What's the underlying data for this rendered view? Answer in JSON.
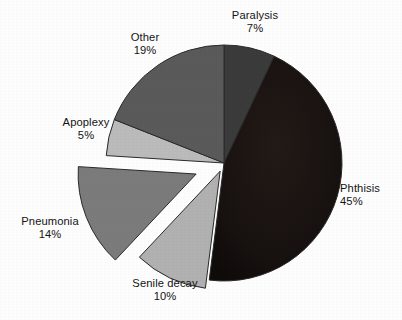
{
  "chart_data": {
    "type": "pie",
    "title": "",
    "subtitle": "",
    "xlabel": "",
    "ylabel": "",
    "legend_position": "none",
    "grid": false,
    "value_unit": "percent",
    "start_angle_deg": 0,
    "direction": "clockwise",
    "center": {
      "x": 224,
      "y": 163
    },
    "radius": 118,
    "categories": [
      "Paralysis",
      "Phthisis",
      "Senile decay",
      "Pneumonia",
      "Apoplexy",
      "Other"
    ],
    "values": [
      7,
      45,
      10,
      14,
      5,
      19
    ],
    "slices": [
      {
        "label": "Paralysis",
        "value": 7,
        "value_text": "7%",
        "color": "#3b3b3b",
        "exploded": false,
        "explode_offset": 0,
        "start_deg": 0,
        "end_deg": 25.2
      },
      {
        "label": "Phthisis",
        "value": 45,
        "value_text": "45%",
        "color": "#191310",
        "exploded": false,
        "explode_offset": 0,
        "start_deg": 25.2,
        "end_deg": 187.2
      },
      {
        "label": "Senile decay",
        "value": 10,
        "value_text": "10%",
        "color": "#b1b1b1",
        "exploded": true,
        "explode_offset": 9,
        "start_deg": 187.2,
        "end_deg": 223.2
      },
      {
        "label": "Pneumonia",
        "value": 14,
        "value_text": "14%",
        "color": "#7b7b7b",
        "exploded": true,
        "explode_offset": 30,
        "start_deg": 223.2,
        "end_deg": 273.6
      },
      {
        "label": "Apoplexy",
        "value": 5,
        "value_text": "5%",
        "color": "#bbbbbb",
        "exploded": false,
        "explode_offset": 0,
        "start_deg": 273.6,
        "end_deg": 291.6
      },
      {
        "label": "Other",
        "value": 19,
        "value_text": "19%",
        "color": "#5a5a5a",
        "exploded": false,
        "explode_offset": 0,
        "start_deg": 291.6,
        "end_deg": 360
      }
    ],
    "colors": {
      "paralysis": "#3b3b3b",
      "phthisis": "#191310",
      "senile_decay": "#b1b1b1",
      "pneumonia": "#7b7b7b",
      "apoplexy": "#bbbbbb",
      "other": "#5a5a5a",
      "background": "#fdfdfd",
      "text": "#141414",
      "outline": "#2a2a2a"
    }
  },
  "labels": {
    "paralysis": {
      "name": "Paralysis",
      "pct": "7%"
    },
    "other": {
      "name": "Other",
      "pct": "19%"
    },
    "apoplexy": {
      "name": "Apoplexy",
      "pct": "5%"
    },
    "pneumonia": {
      "name": "Pneumonia",
      "pct": "14%"
    },
    "senile_decay": {
      "name": "Senile decay",
      "pct": "10%"
    },
    "phthisis": {
      "name": "Phthisis",
      "pct": "45%"
    }
  }
}
